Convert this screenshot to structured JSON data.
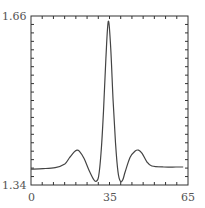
{
  "chart_data": {
    "type": "line",
    "title": "",
    "xlabel": "",
    "ylabel": "",
    "xlim": [
      0,
      65
    ],
    "ylim": [
      1.34,
      1.66
    ],
    "x_tick_labels": [
      "0",
      "35",
      "65"
    ],
    "y_tick_labels": [
      "1.34",
      "1.66"
    ],
    "grid": false,
    "legend": null,
    "series": [
      {
        "name": "curve",
        "x": [
          0,
          5,
          10,
          14,
          16,
          18,
          19,
          20,
          22,
          24,
          26,
          27,
          28,
          29,
          30,
          31,
          32,
          33,
          34,
          35,
          36,
          37,
          38,
          39,
          41,
          43,
          44.5,
          46,
          48,
          50,
          55,
          60,
          63
        ],
        "y": [
          1.37,
          1.371,
          1.373,
          1.38,
          1.392,
          1.403,
          1.406,
          1.404,
          1.39,
          1.368,
          1.35,
          1.347,
          1.356,
          1.4,
          1.48,
          1.58,
          1.65,
          1.6,
          1.5,
          1.42,
          1.365,
          1.347,
          1.35,
          1.365,
          1.392,
          1.404,
          1.406,
          1.4,
          1.384,
          1.376,
          1.374,
          1.374,
          1.374
        ]
      }
    ]
  },
  "labels": {
    "y_top": "1.66",
    "y_bottom": "1.34",
    "x_left": "0",
    "x_mid": "35",
    "x_right": "65"
  },
  "colors": {
    "axis": "#333333",
    "line": "#444444",
    "text": "#555555"
  }
}
